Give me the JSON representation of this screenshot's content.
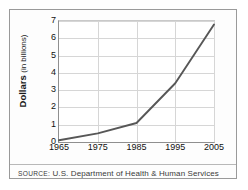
{
  "chart_data": {
    "type": "line",
    "title": "",
    "subtitle": "",
    "xlabel": "",
    "ylabel": "Dollars (in billions)",
    "ylabel_strong": "Dollars",
    "ylabel_soft": "(in billions)",
    "x": [
      1965,
      1975,
      1985,
      1995,
      2005
    ],
    "values": [
      0.1,
      0.5,
      1.1,
      3.4,
      6.8
    ],
    "xtick_labels": [
      "1965",
      "1975",
      "1985",
      "1995",
      "2005"
    ],
    "ytick_labels": [
      "0",
      "1",
      "2",
      "3",
      "4",
      "5",
      "6",
      "7"
    ],
    "ytick_values": [
      0,
      1,
      2,
      3,
      4,
      5,
      6,
      7
    ],
    "xlim": [
      1965,
      2005
    ],
    "ylim": [
      0,
      7
    ],
    "grid": "horizontal-and-vertical",
    "legend": "none",
    "series_color": "#575757",
    "grid_color": "#d6d6d6",
    "axis_color": "#8f8f8f",
    "border_color": "#9a9a9a",
    "text_color": "#111111"
  },
  "footer": {
    "source_label": "SOURCE:",
    "source_text": "U.S. Department of Health & Human Services"
  }
}
